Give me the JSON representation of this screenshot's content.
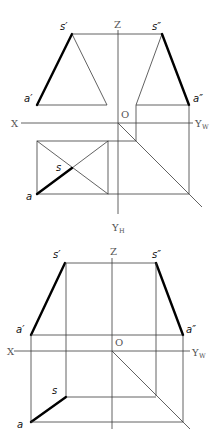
{
  "figure": {
    "views": [
      {
        "id": "top-figure",
        "labels": {
          "s_front": "s′",
          "a_front": "a′",
          "s_side": "s″",
          "a_side": "a″",
          "s_top": "s",
          "a_top": "a",
          "axis_x": "X",
          "axis_z": "Z",
          "axis_yw": "Y",
          "axis_yw_sub": "W",
          "axis_yh": "Y",
          "axis_yh_sub": "H",
          "origin": "O"
        }
      },
      {
        "id": "bottom-figure",
        "labels": {
          "s_front": "s′",
          "a_front": "a′",
          "s_side": "s″",
          "a_side": "a″",
          "s_top": "s",
          "a_top": "a",
          "axis_x": "X",
          "axis_z": "Z",
          "axis_yw": "Y",
          "axis_yw_sub": "W",
          "origin": "O"
        }
      }
    ]
  }
}
